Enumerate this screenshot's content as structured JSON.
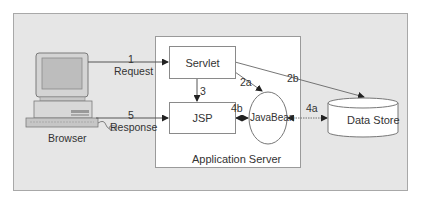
{
  "diagram": {
    "nodes": {
      "browser": {
        "label": "Browser",
        "icon": "desktop-computer-icon"
      },
      "app_server": {
        "label": "Application Server"
      },
      "servlet": {
        "label": "Servlet"
      },
      "jsp": {
        "label": "JSP"
      },
      "javabean": {
        "label": "JavaBean"
      },
      "data_store": {
        "label": "Data Store"
      }
    },
    "edges": {
      "e1": {
        "step": "1",
        "label": "Request",
        "from": "Browser",
        "to": "Servlet"
      },
      "e2a": {
        "step": "2a",
        "from": "Servlet",
        "to": "JavaBean"
      },
      "e2b": {
        "step": "2b",
        "from": "Servlet",
        "to": "Data Store"
      },
      "e3": {
        "step": "3",
        "from": "Servlet",
        "to": "JSP"
      },
      "e4a": {
        "step": "4a",
        "from": "JavaBean",
        "to": "Data Store",
        "bidirectional": true
      },
      "e4b": {
        "step": "4b",
        "from": "JSP",
        "to": "JavaBean",
        "bidirectional": true
      },
      "e5": {
        "step": "5",
        "label": "Response",
        "from": "Browser",
        "to": "JSP"
      }
    },
    "colors": {
      "background": "#e6e6e6",
      "box_fill": "#ffffff",
      "line": "#555555",
      "text": "#333333"
    }
  }
}
